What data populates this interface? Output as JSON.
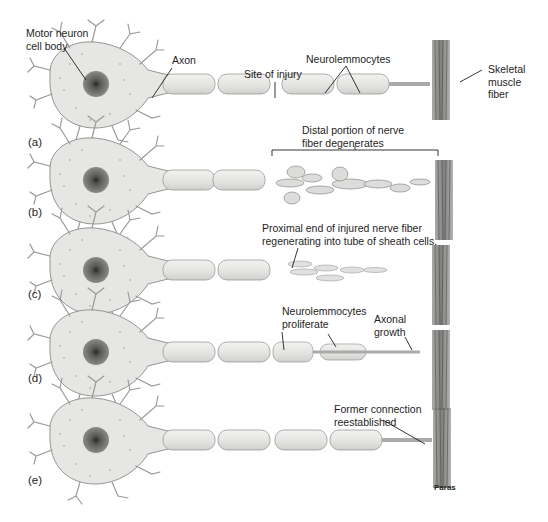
{
  "figure": {
    "type": "diagram",
    "credit": "Paras",
    "colors": {
      "cell_fill": "#e4e4e2",
      "cell_stroke": "#8a8a88",
      "nucleus": "#6e6e6c",
      "nucleolus": "#2a2a2a",
      "muscle": "#7a7a78",
      "text": "#1e1e1e",
      "background": "#ffffff"
    }
  },
  "panels": [
    {
      "letter": "(a)",
      "labels": {
        "cell_body": "Motor neuron\ncell body",
        "axon": "Axon",
        "injury": "Site of injury",
        "neurolemmocytes": "Neurolemmocytes",
        "muscle": "Skeletal\nmuscle\nfiber"
      }
    },
    {
      "letter": "(b)",
      "labels": {
        "distal": "Distal portion of nerve\nfiber degenerates"
      }
    },
    {
      "letter": "(c)",
      "labels": {
        "proximal": "Proximal end of injured nerve fiber\nregenerating into tube of sheath cells."
      }
    },
    {
      "letter": "(d)",
      "labels": {
        "proliferate": "Neurolemmocytes\nproliferate",
        "growth": "Axonal\ngrowth"
      }
    },
    {
      "letter": "(e)",
      "labels": {
        "reestablished": "Former connection\nreestablished"
      }
    }
  ]
}
